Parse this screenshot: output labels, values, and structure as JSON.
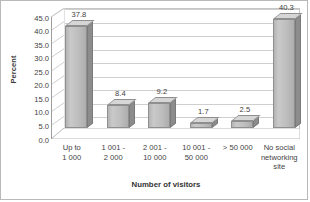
{
  "chart_data": {
    "type": "bar",
    "title": "",
    "subtitle": "",
    "xlabel": "Number of visitors",
    "ylabel": "Percent",
    "categories": [
      "Up to\n1 000",
      "1 001 -\n2 000",
      "2 001 -\n10 000",
      "10 001 -\n50 000",
      "> 50 000",
      "No social\nnetworking\nsite"
    ],
    "values": [
      37.8,
      8.4,
      9.2,
      1.7,
      2.5,
      40.3
    ],
    "data_labels": [
      "37.8",
      "8.4",
      "9.2",
      "1.7",
      "2.5",
      "40.3"
    ],
    "ylim": [
      0.0,
      45.0
    ],
    "ytick_step": 5.0,
    "yticks": [
      45.0,
      40.0,
      35.0,
      30.0,
      25.0,
      20.0,
      15.0,
      10.0,
      5.0,
      0.0
    ],
    "ytick_labels": [
      "45.0",
      "40.0",
      "35.0",
      "30.0",
      "25.0",
      "20.0",
      "15.0",
      "10.0",
      "5.0",
      "0.0"
    ],
    "grid": true,
    "grid_axis": "y",
    "legend": false,
    "legend_position": "none",
    "three_d": true,
    "bar_color": "#bdbdbd",
    "bar_side_color": "#8c8c8c",
    "bar_top_color": "#d6d6d6",
    "bar_border_color": "#8f8f8f",
    "gridline_color": "#cfcfcf",
    "axis_color": "#9e9e9e",
    "text_color": "#3f3f3f",
    "background_color": "#ffffff",
    "border_color": "#b9b9b9"
  }
}
